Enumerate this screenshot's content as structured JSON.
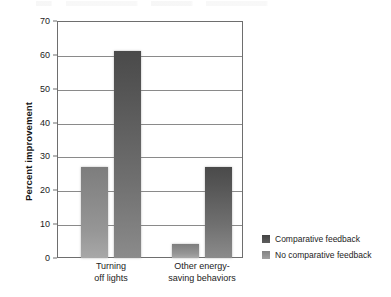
{
  "chart_data": {
    "type": "bar",
    "title": "",
    "subtitle": "",
    "xlabel": "",
    "ylabel": "Percent improvement",
    "ylim": [
      0,
      70
    ],
    "yticks": [
      0,
      10,
      20,
      30,
      40,
      50,
      60,
      70
    ],
    "ytick_labels": [
      "0",
      "10",
      "20",
      "30",
      "40",
      "50",
      "60",
      "70"
    ],
    "grid": true,
    "grid_axis": "y",
    "legend_position": "right",
    "categories": [
      "Turning off lights",
      "Other energy-saving behaviors"
    ],
    "category_lines": [
      [
        "Turning",
        "off lights"
      ],
      [
        "Other energy-",
        "saving behaviors"
      ]
    ],
    "series": [
      {
        "name": "No comparative feedback",
        "color": "#969696",
        "values": [
          27,
          4
        ]
      },
      {
        "name": "Comparative feedback",
        "color": "#5a5a5a",
        "values": [
          61,
          27
        ]
      }
    ],
    "series_draw_order": [
      "No comparative feedback",
      "Comparative feedback"
    ],
    "annotations": []
  },
  "legend": {
    "items": [
      {
        "label": "Comparative feedback",
        "swatch": "dark"
      },
      {
        "label": "No comparative feedback",
        "swatch": "light"
      }
    ]
  },
  "axis": {
    "y_title": "Percent improvement"
  }
}
